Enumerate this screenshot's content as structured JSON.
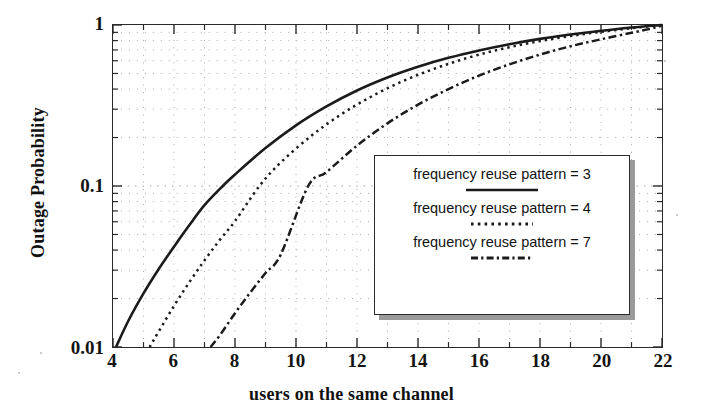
{
  "figure": {
    "background_color": "#ffffff",
    "ink_color": "#1a1a1a"
  },
  "axes": {
    "x": {
      "title": "users on the same channel",
      "scale": "linear",
      "min": 4,
      "max": 22,
      "major_ticks": [
        4,
        6,
        8,
        10,
        12,
        14,
        16,
        18,
        20,
        22
      ],
      "minor_ticks": [
        5,
        7,
        9,
        11,
        13,
        15,
        17,
        19,
        21
      ],
      "tick_labels": [
        "4",
        "6",
        "8",
        "10",
        "12",
        "14",
        "16",
        "18",
        "20",
        "22"
      ]
    },
    "y": {
      "title": "Outage Probability",
      "scale": "log",
      "min": 0.01,
      "max": 1,
      "major_ticks": [
        0.01,
        0.1,
        1
      ],
      "tick_labels": [
        "0.01",
        "0.1",
        "1"
      ]
    },
    "grid": {
      "visible": true,
      "style": "dotted",
      "color": "#a8a8a8"
    }
  },
  "legend": {
    "position": "lower-right-inside",
    "has_shadow": true,
    "entries": [
      {
        "label": "frequency reuse pattern = 3",
        "style": "solid",
        "color": "#1b1b1b"
      },
      {
        "label": "frequency reuse pattern = 4",
        "style": "dotted",
        "color": "#1b1b1b"
      },
      {
        "label": "frequency reuse pattern = 7",
        "style": "dash-dot",
        "color": "#1b1b1b"
      }
    ]
  },
  "chart_data": {
    "type": "line",
    "title": "",
    "subtitle": "",
    "xlabel": "users on the same channel",
    "ylabel": "Outage Probability",
    "xscale": "linear",
    "yscale": "log",
    "xlim": [
      4,
      22
    ],
    "ylim": [
      0.01,
      1
    ],
    "grid": true,
    "legend_position": "lower-right-inside",
    "annotations": [],
    "series": [
      {
        "name": "frequency reuse pattern = 3",
        "style": "solid",
        "color": "#1b1b1b",
        "x": [
          4.1,
          4.5,
          5.0,
          5.5,
          6.0,
          6.5,
          7.0,
          7.6,
          8.0,
          9.0,
          10.0,
          11.0,
          12.0,
          13.0,
          14.0,
          15.0,
          16.0,
          17.0,
          18.0,
          19.0,
          20.0,
          21.0,
          22.0
        ],
        "y": [
          0.01,
          0.0145,
          0.0215,
          0.0305,
          0.042,
          0.057,
          0.076,
          0.1,
          0.118,
          0.172,
          0.238,
          0.312,
          0.392,
          0.472,
          0.55,
          0.625,
          0.695,
          0.76,
          0.82,
          0.872,
          0.92,
          0.965,
          1.0
        ]
      },
      {
        "name": "frequency reuse pattern = 4",
        "style": "dotted",
        "color": "#1b1b1b",
        "x": [
          5.2,
          5.5,
          6.0,
          6.5,
          7.0,
          7.5,
          8.0,
          8.8,
          9.5,
          10.5,
          11.5,
          12.5,
          13.5,
          14.5,
          15.5,
          16.5,
          17.5,
          18.5,
          19.5,
          20.5,
          21.5,
          22.0
        ],
        "y": [
          0.01,
          0.0125,
          0.018,
          0.0252,
          0.0345,
          0.0462,
          0.0605,
          0.1,
          0.14,
          0.205,
          0.28,
          0.362,
          0.448,
          0.532,
          0.615,
          0.692,
          0.762,
          0.825,
          0.882,
          0.932,
          0.978,
          1.0
        ]
      },
      {
        "name": "frequency reuse pattern = 7",
        "style": "dash-dot",
        "color": "#1b1b1b",
        "x": [
          7.2,
          7.5,
          8.0,
          8.5,
          9.0,
          9.5,
          10.4,
          11.0,
          12.0,
          13.0,
          14.0,
          15.0,
          16.0,
          17.0,
          18.0,
          19.0,
          20.0,
          21.0,
          21.8,
          22.0
        ],
        "y": [
          0.01,
          0.0118,
          0.0162,
          0.0218,
          0.0288,
          0.0375,
          0.1,
          0.122,
          0.178,
          0.245,
          0.32,
          0.4,
          0.485,
          0.57,
          0.655,
          0.738,
          0.815,
          0.895,
          0.965,
          1.0
        ]
      }
    ]
  }
}
